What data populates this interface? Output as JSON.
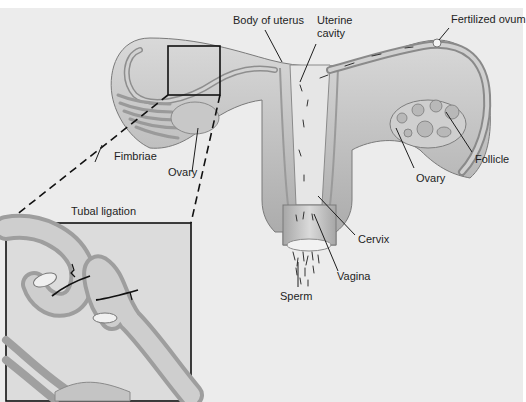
{
  "diagram": {
    "labels": {
      "body_of_uterus": "Body of uterus",
      "uterine_cavity_line1": "Uterine",
      "uterine_cavity_line2": "cavity",
      "fertilized_ovum": "Fertilized ovum",
      "fimbriae": "Fimbriae",
      "ovary_left": "Ovary",
      "ovary_right": "Ovary",
      "follicle": "Follicle",
      "cervix": "Cervix",
      "vagina": "Vagina",
      "sperm": "Sperm"
    },
    "inset": {
      "title": "Tubal ligation"
    },
    "colors": {
      "background": "#ececec",
      "tissue_light": "#d6d6d6",
      "tissue_mid": "#b4b4b4",
      "tissue_dark": "#8c8c8c",
      "line": "#1e1e1e"
    }
  }
}
